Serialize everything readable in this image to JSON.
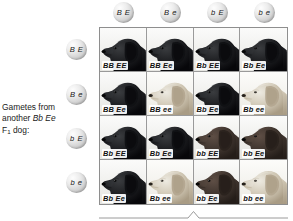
{
  "figure": {
    "top_clipped_caption": "",
    "left_label": {
      "line1": "Gametes from",
      "line2_pre": "another ",
      "line2_italic": "Bb Ee",
      "line3_pre": "F",
      "line3_sub": "1",
      "line3_post": " dog:"
    }
  },
  "column_gametes": [
    {
      "name": "gamete-B-E",
      "label": "B E"
    },
    {
      "name": "gamete-B-e",
      "label": "B e"
    },
    {
      "name": "gamete-b-E",
      "label": "b E"
    },
    {
      "name": "gamete-b-e",
      "label": "b e"
    }
  ],
  "row_gametes": [
    {
      "name": "gamete-B-E",
      "label": "B E"
    },
    {
      "name": "gamete-B-e",
      "label": "B e"
    },
    {
      "name": "gamete-b-E",
      "label": "b E"
    },
    {
      "name": "gamete-b-e",
      "label": "b e"
    }
  ],
  "colors": {
    "black_dark": "#0a0a0a",
    "black_mid": "#17181a",
    "black_light": "#343638",
    "chocolate_dark": "#2a2320",
    "chocolate_mid": "#413631",
    "chocolate_light": "#5b4b43",
    "yellow_dark": "#b8ac96",
    "yellow_mid": "#d8d0c0",
    "yellow_light": "#eeeae0",
    "background": "#f2f2ef",
    "border": "#9a9a9a",
    "ball": "#d3d3d3"
  },
  "cells": [
    {
      "genotype": "BB EE",
      "coat": "black"
    },
    {
      "genotype": "BB Ee",
      "coat": "black"
    },
    {
      "genotype": "Bb EE",
      "coat": "black"
    },
    {
      "genotype": "Bb Ee",
      "coat": "black"
    },
    {
      "genotype": "BB Ee",
      "coat": "black"
    },
    {
      "genotype": "BB ee",
      "coat": "yellow"
    },
    {
      "genotype": "Bb Ee",
      "coat": "black"
    },
    {
      "genotype": "Bb ee",
      "coat": "yellow"
    },
    {
      "genotype": "Bb EE",
      "coat": "black"
    },
    {
      "genotype": "Bb Ee",
      "coat": "black"
    },
    {
      "genotype": "bb EE",
      "coat": "chocolate"
    },
    {
      "genotype": "bb Ee",
      "coat": "chocolate"
    },
    {
      "genotype": "Bb Ee",
      "coat": "black"
    },
    {
      "genotype": "Bb ee",
      "coat": "yellow"
    },
    {
      "genotype": "bb Ee",
      "coat": "chocolate"
    },
    {
      "genotype": "bb ee",
      "coat": "yellow"
    }
  ]
}
